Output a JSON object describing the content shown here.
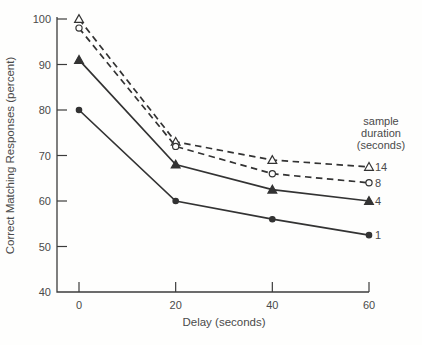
{
  "figure": {
    "colors": {
      "background": "#fefefd",
      "line": "#333333",
      "text": "#4a4a4a",
      "axis": "#3c3c3c",
      "open_marker_fill": "#fefefd"
    },
    "legend_position": "right",
    "grid": false
  },
  "chart_data": {
    "type": "line",
    "title": "",
    "xlabel": "Delay (seconds)",
    "ylabel": "Correct Matching Responses (percent)",
    "x": [
      0,
      20,
      40,
      60
    ],
    "xlim": [
      0,
      60
    ],
    "ylim": [
      40,
      100
    ],
    "xticks": [
      0,
      20,
      40,
      60
    ],
    "yticks": [
      40,
      50,
      60,
      70,
      80,
      90,
      100
    ],
    "legend_title_lines": [
      "sample",
      "duration",
      "(seconds)"
    ],
    "series": [
      {
        "name": "14",
        "values": [
          100,
          73,
          69,
          67.5
        ],
        "line_style": "dashed",
        "marker": "triangle-open"
      },
      {
        "name": "8",
        "values": [
          98,
          72,
          66,
          64
        ],
        "line_style": "dashed",
        "marker": "circle-open"
      },
      {
        "name": "4",
        "values": [
          91,
          68,
          62.5,
          60
        ],
        "line_style": "solid",
        "marker": "triangle-filled"
      },
      {
        "name": "1",
        "values": [
          80,
          60,
          56,
          52.5
        ],
        "line_style": "solid",
        "marker": "circle-filled"
      }
    ]
  }
}
